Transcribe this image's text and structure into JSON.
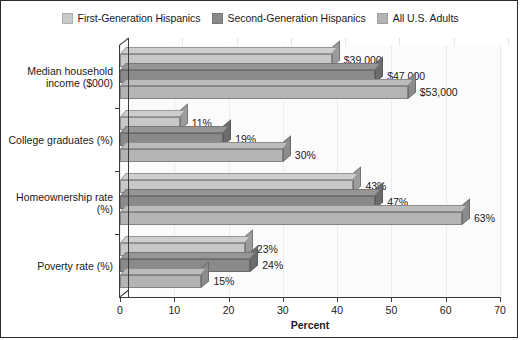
{
  "chart_data": {
    "type": "bar",
    "orientation": "horizontal",
    "title": "",
    "xlabel": "Percent",
    "ylabel": "",
    "xlim": [
      0,
      70
    ],
    "xticks": [
      0,
      10,
      20,
      30,
      40,
      50,
      60,
      70
    ],
    "grid": true,
    "legend_position": "top",
    "categories": [
      "Median household income ($000)",
      "College graduates (%)",
      "Homeownership rate (%)",
      "Poverty rate (%)"
    ],
    "series": [
      {
        "name": "First-Generation Hispanics",
        "color": "#c8c8c8",
        "values": [
          39,
          11,
          43,
          23
        ],
        "labels": [
          "$39,000",
          "11%",
          "43%",
          "23%"
        ]
      },
      {
        "name": "Second-Generation Hispanics",
        "color": "#8a8a8a",
        "values": [
          47,
          19,
          47,
          24
        ],
        "labels": [
          "$47,000",
          "19%",
          "47%",
          "24%"
        ]
      },
      {
        "name": "All U.S. Adults",
        "color": "#b4b4b4",
        "values": [
          53,
          30,
          63,
          15
        ],
        "labels": [
          "$53,000",
          "30%",
          "63%",
          "15%"
        ]
      }
    ]
  },
  "legend": {
    "items": [
      {
        "label": "First-Generation Hispanics",
        "color": "#c8c8c8"
      },
      {
        "label": "Second-Generation Hispanics",
        "color": "#8a8a8a"
      },
      {
        "label": "All U.S. Adults",
        "color": "#b4b4b4"
      }
    ]
  },
  "axes": {
    "x_title": "Percent",
    "x_tick_labels": [
      "0",
      "10",
      "20",
      "30",
      "40",
      "50",
      "60",
      "70"
    ],
    "y_category_labels": [
      "Median household income ($000)",
      "College graduates (%)",
      "Homeownership rate (%)",
      "Poverty rate (%)"
    ]
  }
}
